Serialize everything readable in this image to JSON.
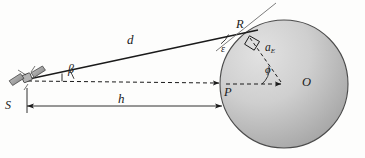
{
  "figure": {
    "kind": "geometry-diagram",
    "background_color": "#fdfdfc",
    "stroke_color": "#1a1a1a",
    "earth_fill_light": "#d8d8d8",
    "earth_fill_dark": "#9a9a9a",
    "earth_edge_color": "#4a4a4a"
  },
  "points": {
    "satellite": {
      "id": "S-icon",
      "label": "",
      "x": 26,
      "y": 80
    },
    "tangent_point": {
      "id": "R",
      "label": "R",
      "x": 247,
      "y": 35
    },
    "surface_point": {
      "id": "P",
      "label": "P",
      "x": 222,
      "y": 84
    },
    "earth_center": {
      "id": "O",
      "label": "O",
      "x": 284,
      "y": 84
    }
  },
  "labels": {
    "distance_d": "d",
    "height_h": "h",
    "offset_S": "S",
    "point_R": "R",
    "point_P": "P",
    "point_O": "O",
    "angle_beta": "β",
    "angle_epsilon": "ε",
    "angle_phi": "ϕ",
    "radius_a": "a",
    "radius_a_sub": "E"
  },
  "geometry": {
    "earth": {
      "cx": 284,
      "cy": 84,
      "r": 64
    },
    "line_of_sight": {
      "from": "satellite",
      "to": "tangent_point",
      "style": "solid",
      "label": "d"
    },
    "axis_line": {
      "from": "satellite",
      "to": "earth_center",
      "style": "dashed",
      "arrow_at": "P"
    },
    "radius_line": {
      "from": "earth_center",
      "to": "tangent_point",
      "style": "dashed",
      "label": "a_E"
    },
    "tangent_line": {
      "through": "R",
      "style": "solid-thin",
      "extends_both_ways": true
    },
    "right_angle_marker": {
      "at": "R",
      "between": [
        "tangent_line",
        "radius_line"
      ]
    },
    "dimension_h": {
      "from_x": 26,
      "to_x": 222,
      "y": 106,
      "arrows": "both",
      "label": "h"
    },
    "dimension_S": {
      "x": 26,
      "label": "S",
      "tick": true
    }
  },
  "angles": [
    {
      "name": "beta",
      "symbol": "β",
      "vertex": "satellite",
      "between": [
        "axis_line",
        "line_of_sight"
      ]
    },
    {
      "name": "epsilon",
      "symbol": "ε",
      "vertex": "tangent_point",
      "between": [
        "line_of_sight",
        "tangent_line"
      ]
    },
    {
      "name": "phi",
      "symbol": "ϕ",
      "vertex": "earth_center",
      "between": [
        "axis_line",
        "radius_line"
      ]
    }
  ]
}
